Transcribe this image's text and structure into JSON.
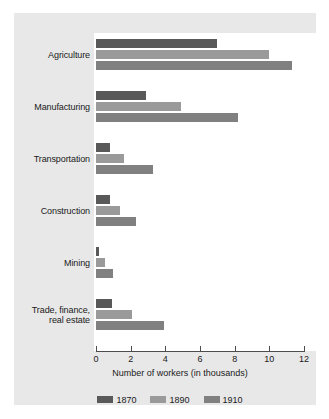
{
  "chart_data": {
    "type": "bar",
    "orientation": "horizontal",
    "title": "",
    "xlabel": "Number of workers (in thousands)",
    "ylabel": "",
    "xlim": [
      0,
      12
    ],
    "xticks": [
      0,
      2,
      4,
      6,
      8,
      10,
      12
    ],
    "xtick_labels": [
      "0",
      "2",
      "4",
      "6",
      "8",
      "10",
      "12"
    ],
    "grid": false,
    "legend_position": "bottom",
    "categories": [
      "Agriculture",
      "Manufacturing",
      "Transportation",
      "Construction",
      "Mining",
      "Trade, finance, real estate"
    ],
    "category_lines": [
      [
        "Agriculture"
      ],
      [
        "Manufacturing"
      ],
      [
        "Transportation"
      ],
      [
        "Construction"
      ],
      [
        "Mining"
      ],
      [
        "Trade, finance,",
        "real estate"
      ]
    ],
    "series": [
      {
        "name": "1870",
        "color": "#595959",
        "values": [
          7.0,
          2.9,
          0.8,
          0.8,
          0.15,
          0.9
        ]
      },
      {
        "name": "1890",
        "color": "#9a9a9a",
        "values": [
          10.0,
          4.9,
          1.6,
          1.4,
          0.5,
          2.1
        ]
      },
      {
        "name": "1910",
        "color": "#808080",
        "values": [
          11.3,
          8.2,
          3.3,
          2.3,
          1.0,
          3.9
        ]
      }
    ]
  },
  "legend": {
    "items": [
      {
        "label": "1870",
        "color": "#595959"
      },
      {
        "label": "1890",
        "color": "#9a9a9a"
      },
      {
        "label": "1910",
        "color": "#808080"
      }
    ]
  },
  "colors": {
    "page_background": "#ffffff",
    "panel_background": "#e8e8e8",
    "plot_background": "#ffffff",
    "axis": "#4d4d4d",
    "text": "#1a1a1a"
  }
}
